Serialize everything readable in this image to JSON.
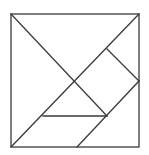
{
  "diagram": {
    "title": "",
    "type": "tangram",
    "stroke_color": "#3a3a3a",
    "background": "#ffffff",
    "outer_square": {
      "x1": 11,
      "y1": 14,
      "x2": 139,
      "y2": 147
    },
    "lines": [
      {
        "id": "diag-main",
        "x1": 11,
        "y1": 147,
        "x2": 139,
        "y2": 14
      },
      {
        "id": "diag-tl",
        "x1": 11,
        "y1": 14,
        "x2": 107,
        "y2": 116
      },
      {
        "id": "right-square-top",
        "x1": 107,
        "y1": 49,
        "x2": 139,
        "y2": 81
      },
      {
        "id": "lower-diag",
        "x1": 139,
        "y1": 81,
        "x2": 77,
        "y2": 147
      },
      {
        "id": "horizontal",
        "x1": 43,
        "y1": 116,
        "x2": 107,
        "y2": 116
      }
    ],
    "pieces": 7
  }
}
